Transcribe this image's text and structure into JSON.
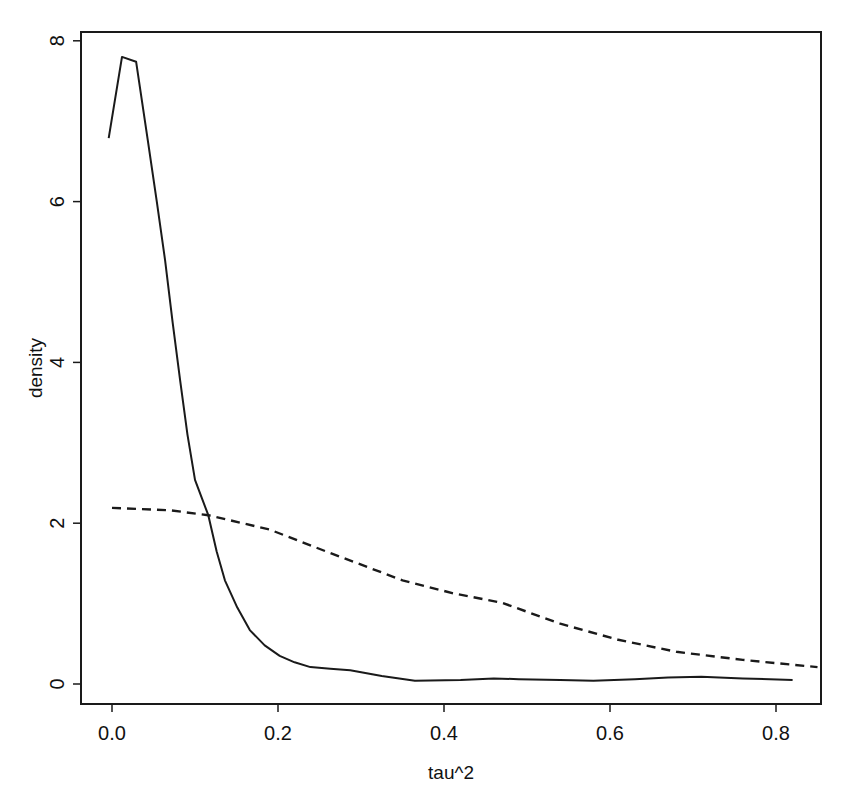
{
  "chart_data": {
    "type": "line",
    "title": "",
    "xlabel": "tau^2",
    "ylabel": "density",
    "xlim": [
      -0.035,
      0.855
    ],
    "ylim": [
      -0.25,
      8.1
    ],
    "grid": false,
    "legend": null,
    "x_ticks": [
      0.0,
      0.2,
      0.4,
      0.6,
      0.8
    ],
    "x_tick_labels": [
      "0.0",
      "0.2",
      "0.4",
      "0.6",
      "0.8"
    ],
    "y_ticks": [
      0,
      2,
      4,
      6,
      8
    ],
    "y_tick_labels": [
      "0",
      "2",
      "4",
      "6",
      "8"
    ],
    "series": [
      {
        "name": "posterior (solid)",
        "style": "solid",
        "x": [
          -0.004,
          0.012,
          0.029,
          0.043,
          0.054,
          0.064,
          0.073,
          0.082,
          0.091,
          0.1,
          0.116,
          0.126,
          0.136,
          0.151,
          0.166,
          0.184,
          0.202,
          0.22,
          0.239,
          0.263,
          0.287,
          0.325,
          0.365,
          0.42,
          0.46,
          0.49,
          0.54,
          0.58,
          0.63,
          0.67,
          0.71,
          0.76,
          0.82
        ],
        "y": [
          6.79,
          7.8,
          7.74,
          6.77,
          6.0,
          5.27,
          4.5,
          3.78,
          3.1,
          2.54,
          2.1,
          1.65,
          1.29,
          0.95,
          0.67,
          0.48,
          0.35,
          0.27,
          0.21,
          0.19,
          0.17,
          0.1,
          0.04,
          0.05,
          0.07,
          0.06,
          0.05,
          0.04,
          0.06,
          0.08,
          0.09,
          0.07,
          0.05
        ]
      },
      {
        "name": "prior (dashed)",
        "style": "dashed",
        "x": [
          0.0,
          0.07,
          0.116,
          0.19,
          0.26,
          0.35,
          0.41,
          0.47,
          0.54,
          0.61,
          0.68,
          0.76,
          0.85
        ],
        "y": [
          2.19,
          2.16,
          2.1,
          1.92,
          1.64,
          1.29,
          1.13,
          1.01,
          0.75,
          0.55,
          0.4,
          0.3,
          0.21
        ]
      }
    ]
  },
  "plot": {
    "frame": {
      "left": 81,
      "top": 32,
      "right": 821,
      "bottom": 704
    },
    "x_scale": {
      "px_at_zero": 112,
      "px_per_unit": 830
    },
    "y_scale": {
      "px_at_zero": 684,
      "px_per_unit": 80.4
    },
    "line_color": "#1a1a1a"
  }
}
